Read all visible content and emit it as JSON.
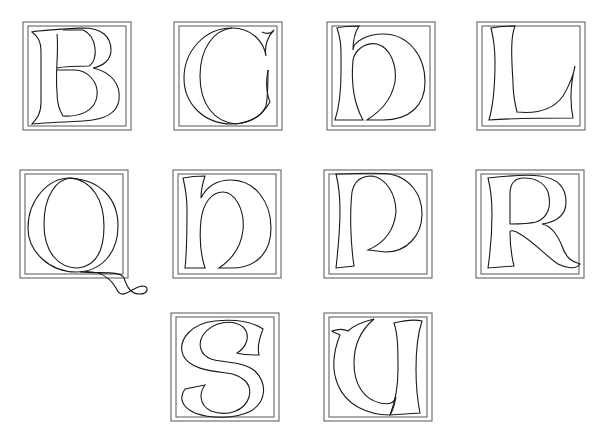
{
  "colors": {
    "background": "#ffffff",
    "stroke": "#1a1a1a",
    "frame": "#555555"
  },
  "letters": [
    {
      "char": "B",
      "row": 1,
      "x": 23,
      "y": 22
    },
    {
      "char": "C",
      "row": 1,
      "x": 174,
      "y": 22
    },
    {
      "char": "h",
      "row": 1,
      "x": 327,
      "y": 22
    },
    {
      "char": "L",
      "row": 1,
      "x": 477,
      "y": 22
    },
    {
      "char": "Q",
      "row": 2,
      "x": 20,
      "y": 170
    },
    {
      "char": "n",
      "row": 2,
      "x": 173,
      "y": 170
    },
    {
      "char": "P",
      "row": 2,
      "x": 324,
      "y": 170
    },
    {
      "char": "R",
      "row": 2,
      "x": 476,
      "y": 170
    },
    {
      "char": "S",
      "row": 3,
      "x": 171,
      "y": 313
    },
    {
      "char": "U",
      "row": 3,
      "x": 324,
      "y": 313
    }
  ]
}
